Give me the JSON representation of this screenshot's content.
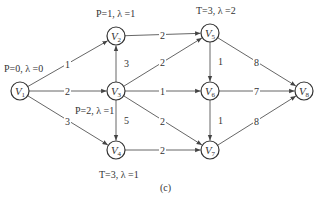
{
  "diagram": {
    "caption": "(c)",
    "nodes": [
      {
        "id": "V1",
        "label": "V",
        "sub": "1",
        "x": 20,
        "y": 91
      },
      {
        "id": "V2",
        "label": "V",
        "sub": "2",
        "x": 116,
        "y": 36
      },
      {
        "id": "V3",
        "label": "V",
        "sub": "3",
        "x": 116,
        "y": 91
      },
      {
        "id": "V4",
        "label": "V",
        "sub": "4",
        "x": 116,
        "y": 150
      },
      {
        "id": "V5",
        "label": "V",
        "sub": "5",
        "x": 210,
        "y": 33
      },
      {
        "id": "V6",
        "label": "V",
        "sub": "6",
        "x": 210,
        "y": 91
      },
      {
        "id": "V7",
        "label": "V",
        "sub": "7",
        "x": 210,
        "y": 150
      },
      {
        "id": "V8",
        "label": "V",
        "sub": "8",
        "x": 304,
        "y": 91
      }
    ],
    "edges": [
      {
        "from": "V1",
        "to": "V2",
        "weight": "1"
      },
      {
        "from": "V1",
        "to": "V3",
        "weight": "2"
      },
      {
        "from": "V1",
        "to": "V4",
        "weight": "3"
      },
      {
        "from": "V3",
        "to": "V2",
        "weight": "3"
      },
      {
        "from": "V3",
        "to": "V4",
        "weight": "5"
      },
      {
        "from": "V2",
        "to": "V5",
        "weight": "2"
      },
      {
        "from": "V3",
        "to": "V5",
        "weight": "2"
      },
      {
        "from": "V3",
        "to": "V6",
        "weight": "1"
      },
      {
        "from": "V3",
        "to": "V7",
        "weight": "2"
      },
      {
        "from": "V4",
        "to": "V7",
        "weight": "2"
      },
      {
        "from": "V5",
        "to": "V6",
        "weight": "1"
      },
      {
        "from": "V6",
        "to": "V7",
        "weight": "1"
      },
      {
        "from": "V5",
        "to": "V8",
        "weight": "8"
      },
      {
        "from": "V6",
        "to": "V8",
        "weight": "7"
      },
      {
        "from": "V7",
        "to": "V8",
        "weight": "8"
      }
    ],
    "annotations": {
      "v1": "P=0, λ =0",
      "v2": "P=1, λ =1",
      "v3": "P=2, λ =1",
      "v4": "T=3, λ =1",
      "v5": "T=3, λ =2"
    }
  }
}
